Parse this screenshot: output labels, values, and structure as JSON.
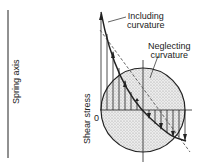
{
  "diagram": {
    "spring_axis_label": "Spring axis",
    "shear_stress_label": "Shear stress",
    "zero_label": "0",
    "curves": [
      {
        "name": "Including curvature",
        "line1": "Including",
        "line2": "curvature",
        "style": "solid"
      },
      {
        "name": "Neglecting curvature",
        "line1": "Neglecting",
        "line2": "curvature",
        "style": "dashed"
      }
    ],
    "colors": {
      "ink": "#222222",
      "section_fill": "#d9d9d9",
      "background": "#ffffff"
    }
  }
}
